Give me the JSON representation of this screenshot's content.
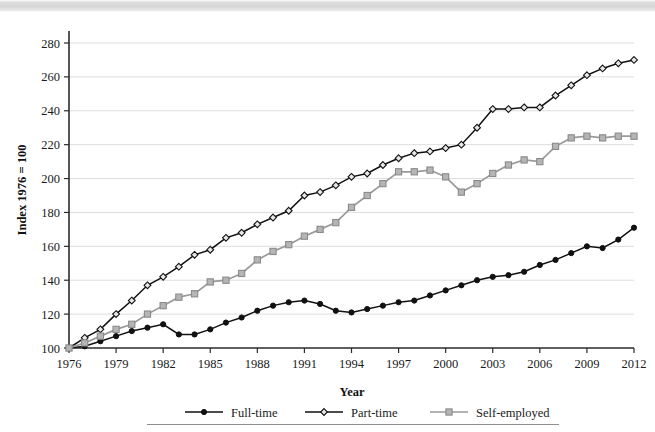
{
  "chart_data": {
    "type": "line",
    "title": "",
    "xlabel": "Year",
    "ylabel": "Index 1976 = 100",
    "xlim": [
      1976,
      2012
    ],
    "ylim": [
      100,
      280
    ],
    "ytick_step": 20,
    "xtick_step": 3,
    "grid": "horizontal",
    "legend_position": "bottom",
    "ytick_labels": [
      "100",
      "120",
      "140",
      "160",
      "180",
      "200",
      "220",
      "240",
      "260",
      "280"
    ],
    "xtick_labels": [
      "1976",
      "1979",
      "1982",
      "1985",
      "1988",
      "1991",
      "1994",
      "1997",
      "2000",
      "2003",
      "2006",
      "2009",
      "2012"
    ],
    "x": [
      1976,
      1977,
      1978,
      1979,
      1980,
      1981,
      1982,
      1983,
      1984,
      1985,
      1986,
      1987,
      1988,
      1989,
      1990,
      1991,
      1992,
      1993,
      1994,
      1995,
      1996,
      1997,
      1998,
      1999,
      2000,
      2001,
      2002,
      2003,
      2004,
      2005,
      2006,
      2007,
      2008,
      2009,
      2010,
      2011,
      2012
    ],
    "series": [
      {
        "name": "Full-time",
        "marker": "filled-circle",
        "color": "#111111",
        "values": [
          100,
          101,
          104,
          107,
          110,
          112,
          114,
          108,
          108,
          111,
          115,
          118,
          122,
          125,
          127,
          128,
          126,
          122,
          121,
          123,
          125,
          127,
          128,
          131,
          134,
          137,
          140,
          142,
          143,
          145,
          149,
          152,
          156,
          160,
          159,
          164,
          171
        ]
      },
      {
        "name": "Part-time",
        "marker": "open-diamond",
        "color": "#111111",
        "values": [
          100,
          106,
          111,
          120,
          128,
          137,
          142,
          148,
          155,
          158,
          165,
          168,
          173,
          177,
          181,
          190,
          192,
          196,
          201,
          203,
          208,
          212,
          215,
          216,
          218,
          220,
          230,
          241,
          241,
          242,
          242,
          249,
          255,
          261,
          265,
          268,
          270
        ]
      },
      {
        "name": "Self-employed",
        "marker": "gray-square",
        "color": "#b5b5b5",
        "values": [
          100,
          103,
          107,
          111,
          114,
          120,
          125,
          130,
          132,
          139,
          140,
          144,
          152,
          157,
          161,
          166,
          170,
          174,
          183,
          190,
          197,
          204,
          204,
          205,
          201,
          192,
          197,
          203,
          208,
          211,
          210,
          219,
          224,
          225,
          224,
          225,
          225
        ]
      }
    ]
  },
  "legend": {
    "items": [
      {
        "label": "Full-time",
        "marker": "filled-circle"
      },
      {
        "label": "Part-time",
        "marker": "open-diamond"
      },
      {
        "label": "Self-employed",
        "marker": "gray-square"
      }
    ]
  },
  "colors": {
    "full_time": "#111111",
    "part_time": "#111111",
    "self_employed": "#b5b5b5",
    "grid": "#dddddd",
    "axis": "#2b2b2b"
  }
}
